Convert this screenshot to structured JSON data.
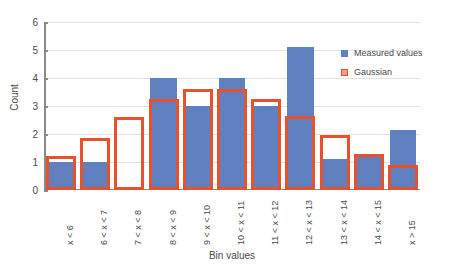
{
  "chart_data": {
    "type": "bar",
    "title": "",
    "xlabel": "Bin values",
    "ylabel": "Count",
    "ylim": [
      0,
      6
    ],
    "yticks": [
      0,
      1,
      2,
      3,
      4,
      5,
      6
    ],
    "grid": true,
    "legend_position": "top-right",
    "categories": [
      "x < 6",
      "6 < x < 7",
      "7 < x < 8",
      "8 < x < 9",
      "9 < x < 10",
      "10 < x < 11",
      "11 < x < 12",
      "12 < x < 13",
      "13 < x < 14",
      "14 < x < 15",
      "x > 15"
    ],
    "series": [
      {
        "name": "Measured values",
        "color": "#6180c0",
        "style": "filled-bar",
        "values": [
          1,
          1,
          0,
          4,
          3,
          4,
          3,
          5.1,
          1.1,
          1.25,
          2.15
        ]
      },
      {
        "name": "Gaussian",
        "color": "#e7512c",
        "style": "outlined-bar",
        "values": [
          1.2,
          1.85,
          2.6,
          3.25,
          3.6,
          3.6,
          3.25,
          2.65,
          1.95,
          1.3,
          0.9
        ]
      }
    ]
  },
  "legend": {
    "items": [
      {
        "label": "Measured values",
        "swatch": "blue-square"
      },
      {
        "label": "Gaussian",
        "swatch": "red-outline-square"
      }
    ]
  },
  "axes": {
    "y_title": "Count",
    "x_title": "Bin values",
    "y_tick_labels": [
      "0",
      "1",
      "2",
      "3",
      "4",
      "5",
      "6"
    ]
  },
  "colors": {
    "measured": "#6180c0",
    "gaussian": "#e7512c",
    "grid": "#e3e3e3",
    "axis": "#8a8a8a",
    "text": "#4a4a4a",
    "background": "#ffffff"
  }
}
